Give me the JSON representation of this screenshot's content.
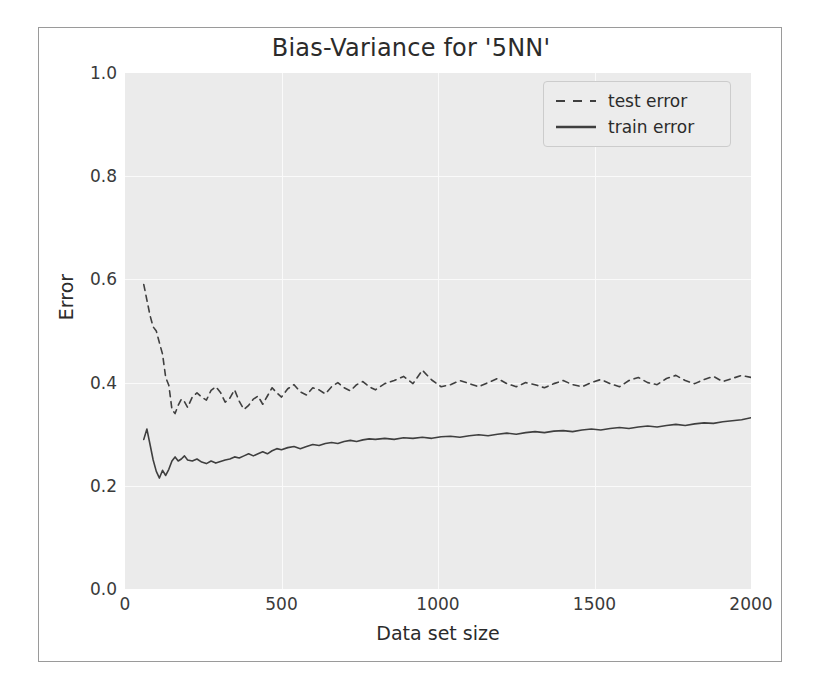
{
  "chart_data": {
    "type": "line",
    "title": "Bias-Variance for '5NN'",
    "xlabel": "Data set size",
    "ylabel": "Error",
    "xlim": [
      0,
      2000
    ],
    "ylim": [
      0.0,
      1.0
    ],
    "xticks": [
      0,
      500,
      1000,
      1500,
      2000
    ],
    "xtick_labels": [
      "0",
      "500",
      "1000",
      "1500",
      "2000"
    ],
    "yticks": [
      0.0,
      0.2,
      0.4,
      0.6,
      0.8,
      1.0
    ],
    "ytick_labels": [
      "0.0",
      "0.2",
      "0.4",
      "0.6",
      "0.8",
      "1.0"
    ],
    "grid": true,
    "grid_color": "#fafafa",
    "plot_background": "#ebebeb",
    "legend_position": "upper right",
    "series": [
      {
        "name": "test error",
        "linestyle": "dashed",
        "color": "#3f3f3f",
        "x": [
          60,
          70,
          80,
          90,
          100,
          110,
          120,
          130,
          140,
          150,
          160,
          170,
          180,
          190,
          200,
          215,
          230,
          245,
          260,
          275,
          290,
          305,
          320,
          335,
          350,
          365,
          380,
          395,
          410,
          425,
          440,
          455,
          470,
          485,
          500,
          520,
          540,
          560,
          580,
          600,
          620,
          640,
          660,
          680,
          700,
          720,
          740,
          760,
          780,
          800,
          830,
          860,
          890,
          920,
          950,
          980,
          1010,
          1040,
          1070,
          1100,
          1130,
          1160,
          1190,
          1220,
          1250,
          1280,
          1310,
          1340,
          1370,
          1400,
          1430,
          1460,
          1490,
          1520,
          1550,
          1580,
          1610,
          1640,
          1670,
          1700,
          1730,
          1760,
          1790,
          1820,
          1850,
          1880,
          1910,
          1940,
          1970,
          2000
        ],
        "y": [
          0.59,
          0.56,
          0.53,
          0.508,
          0.5,
          0.477,
          0.455,
          0.41,
          0.395,
          0.348,
          0.34,
          0.356,
          0.368,
          0.363,
          0.352,
          0.372,
          0.38,
          0.372,
          0.366,
          0.385,
          0.392,
          0.381,
          0.362,
          0.37,
          0.386,
          0.364,
          0.348,
          0.356,
          0.368,
          0.374,
          0.358,
          0.374,
          0.39,
          0.38,
          0.372,
          0.388,
          0.396,
          0.382,
          0.376,
          0.39,
          0.386,
          0.378,
          0.392,
          0.4,
          0.39,
          0.384,
          0.396,
          0.402,
          0.392,
          0.386,
          0.398,
          0.404,
          0.412,
          0.398,
          0.424,
          0.405,
          0.392,
          0.396,
          0.404,
          0.398,
          0.392,
          0.4,
          0.408,
          0.398,
          0.392,
          0.4,
          0.396,
          0.39,
          0.398,
          0.404,
          0.396,
          0.392,
          0.4,
          0.406,
          0.398,
          0.392,
          0.404,
          0.41,
          0.4,
          0.396,
          0.408,
          0.414,
          0.404,
          0.398,
          0.406,
          0.412,
          0.402,
          0.408,
          0.414,
          0.41
        ]
      },
      {
        "name": "train error",
        "linestyle": "solid",
        "color": "#3f3f3f",
        "x": [
          60,
          70,
          80,
          90,
          100,
          110,
          120,
          130,
          140,
          150,
          160,
          170,
          180,
          190,
          200,
          215,
          230,
          245,
          260,
          275,
          290,
          305,
          320,
          335,
          350,
          365,
          380,
          395,
          410,
          425,
          440,
          455,
          470,
          485,
          500,
          520,
          540,
          560,
          580,
          600,
          620,
          640,
          660,
          680,
          700,
          720,
          740,
          760,
          780,
          800,
          830,
          860,
          890,
          920,
          950,
          980,
          1010,
          1040,
          1070,
          1100,
          1130,
          1160,
          1190,
          1220,
          1250,
          1280,
          1310,
          1340,
          1370,
          1400,
          1430,
          1460,
          1490,
          1520,
          1550,
          1580,
          1610,
          1640,
          1670,
          1700,
          1730,
          1760,
          1790,
          1820,
          1850,
          1880,
          1910,
          1940,
          1970,
          2000
        ],
        "y": [
          0.29,
          0.31,
          0.28,
          0.25,
          0.228,
          0.215,
          0.23,
          0.22,
          0.232,
          0.248,
          0.256,
          0.248,
          0.252,
          0.258,
          0.25,
          0.248,
          0.252,
          0.246,
          0.243,
          0.248,
          0.244,
          0.247,
          0.25,
          0.252,
          0.256,
          0.254,
          0.258,
          0.262,
          0.258,
          0.262,
          0.266,
          0.262,
          0.268,
          0.272,
          0.27,
          0.274,
          0.276,
          0.272,
          0.276,
          0.28,
          0.278,
          0.282,
          0.284,
          0.282,
          0.286,
          0.288,
          0.286,
          0.289,
          0.291,
          0.29,
          0.292,
          0.29,
          0.293,
          0.292,
          0.294,
          0.292,
          0.295,
          0.296,
          0.294,
          0.297,
          0.299,
          0.297,
          0.3,
          0.302,
          0.3,
          0.303,
          0.305,
          0.303,
          0.306,
          0.307,
          0.305,
          0.308,
          0.31,
          0.308,
          0.311,
          0.313,
          0.311,
          0.314,
          0.316,
          0.314,
          0.317,
          0.319,
          0.317,
          0.32,
          0.322,
          0.321,
          0.324,
          0.326,
          0.328,
          0.332
        ]
      }
    ]
  }
}
